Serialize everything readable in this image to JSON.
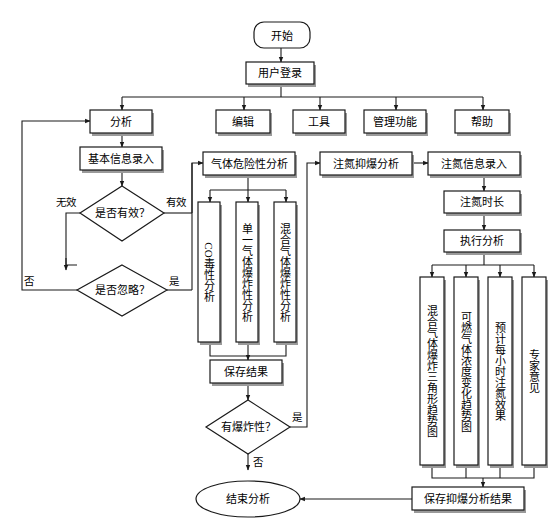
{
  "diagram": {
    "colors": {
      "line": "#1a1a1a",
      "fill": "#ffffff",
      "shadow": "#9a9a9a",
      "text": "#000000"
    },
    "nodes": {
      "start": {
        "label": "开始",
        "shape": "rounded"
      },
      "login": {
        "label": "用户登录",
        "shape": "rect"
      },
      "menu_analysis": {
        "label": "分析",
        "shape": "rect"
      },
      "menu_edit": {
        "label": "编辑",
        "shape": "rect"
      },
      "menu_tools": {
        "label": "工具",
        "shape": "rect"
      },
      "menu_admin": {
        "label": "管理功能",
        "shape": "rect"
      },
      "menu_help": {
        "label": "帮助",
        "shape": "rect"
      },
      "basic_info": {
        "label": "基本信息录入",
        "shape": "rect"
      },
      "gas_hazard": {
        "label": "气体危险性分析",
        "shape": "rect"
      },
      "n2_suppress": {
        "label": "注氮抑爆分析",
        "shape": "rect"
      },
      "n2_info": {
        "label": "注氮信息录入",
        "shape": "rect"
      },
      "valid_q": {
        "label": "是否有效？",
        "shape": "diamond"
      },
      "ignore_q": {
        "label": "是否忽略？",
        "shape": "diamond"
      },
      "co_tox": {
        "label": "CO毒性分析",
        "shape": "rect-vertical"
      },
      "single_gas": {
        "label": "单一气体爆炸性分析",
        "shape": "rect-vertical"
      },
      "mixed_gas": {
        "label": "混合气体爆炸性分析",
        "shape": "rect-vertical"
      },
      "save_result": {
        "label": "保存结果",
        "shape": "rect"
      },
      "explosive_q": {
        "label": "有爆炸性？",
        "shape": "diamond"
      },
      "n2_duration": {
        "label": "注氮时长",
        "shape": "rect"
      },
      "run_analysis": {
        "label": "执行分析",
        "shape": "rect"
      },
      "tri_trend": {
        "label": "混合气体爆炸三角形趋势图",
        "shape": "rect-vertical"
      },
      "conc_trend": {
        "label": "可燃气体浓度变化趋势图",
        "shape": "rect-vertical"
      },
      "hourly_effect": {
        "label": "预计每小时注氮效果",
        "shape": "rect-vertical"
      },
      "expert": {
        "label": "专家意见",
        "shape": "rect-vertical"
      },
      "save_suppress": {
        "label": "保存抑爆分析结果",
        "shape": "rect"
      },
      "end": {
        "label": "结束分析",
        "shape": "ellipse"
      }
    },
    "edge_labels": {
      "invalid": "无效",
      "valid": "有效",
      "ignore_no": "否",
      "ignore_yes": "是",
      "explosive_yes": "是",
      "explosive_no": "否"
    }
  }
}
